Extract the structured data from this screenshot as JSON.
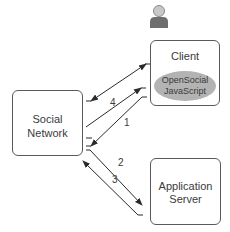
{
  "diagram": {
    "nodes": {
      "client": {
        "label": "Client",
        "component": {
          "line1": "OpenSocial",
          "line2": "JavaScript",
          "color": "#b3b3b3"
        }
      },
      "social_network": {
        "line1": "Social",
        "line2": "Network"
      },
      "application_server": {
        "line1": "Application",
        "line2": "Server"
      }
    },
    "user_icon": "person-icon",
    "edges": [
      {
        "id": "bidirectional",
        "from": "social_network",
        "to": "client",
        "label": "",
        "direction": "both"
      },
      {
        "id": "step4",
        "from": "social_network",
        "to": "client",
        "label": "4"
      },
      {
        "id": "step1",
        "from": "client",
        "to": "social_network",
        "label": "1"
      },
      {
        "id": "step2",
        "from": "social_network",
        "to": "application_server",
        "label": "2"
      },
      {
        "id": "step3",
        "from": "application_server",
        "to": "social_network",
        "label": "3"
      }
    ],
    "colors": {
      "stroke": "#3a3a3a",
      "box_border": "#5a5a5a",
      "ellipse": "#b3b3b3",
      "person": "#7a7a7a"
    }
  }
}
